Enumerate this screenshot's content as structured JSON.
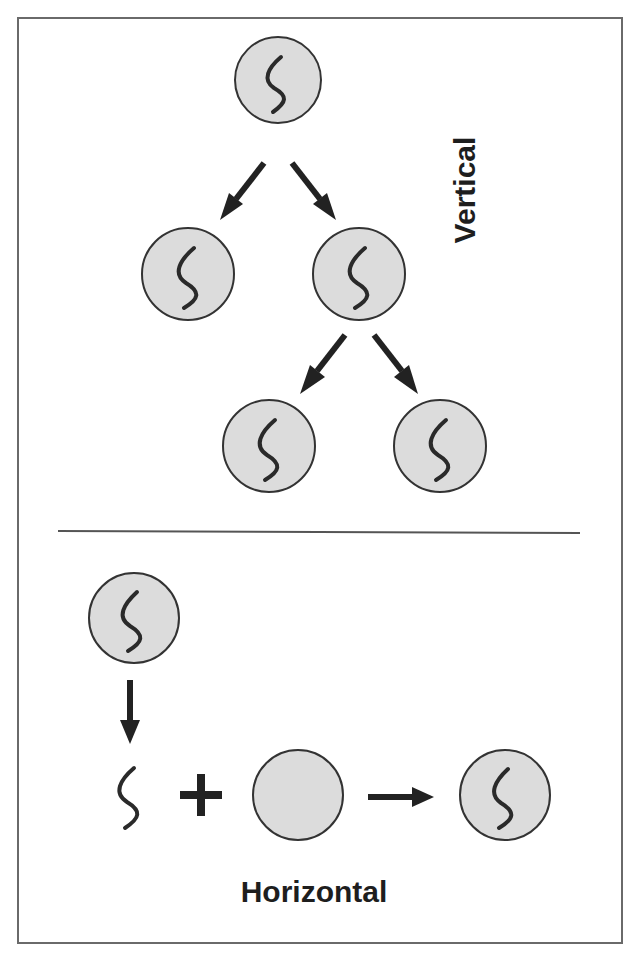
{
  "diagram": {
    "labels": {
      "vertical": "Vertical",
      "horizontal": "Horizontal"
    },
    "colors": {
      "cell_fill": "#dcdcdc",
      "cell_stroke": "#333333",
      "arrow": "#222222",
      "text": "#1e1e1e",
      "frame": "#6a6a6a"
    },
    "vertical_section": {
      "nodes": [
        {
          "id": "parent",
          "has_gene": true
        },
        {
          "id": "child-left",
          "has_gene": true
        },
        {
          "id": "child-right",
          "has_gene": true
        },
        {
          "id": "grandchild-left",
          "has_gene": true
        },
        {
          "id": "grandchild-right",
          "has_gene": true
        }
      ],
      "edges": [
        {
          "from": "parent",
          "to": "child-left"
        },
        {
          "from": "parent",
          "to": "child-right"
        },
        {
          "from": "child-right",
          "to": "grandchild-left"
        },
        {
          "from": "child-right",
          "to": "grandchild-right"
        }
      ]
    },
    "horizontal_section": {
      "nodes": [
        {
          "id": "donor",
          "has_gene": true
        },
        {
          "id": "free-gene",
          "has_gene": true
        },
        {
          "id": "recipient",
          "has_gene": false
        },
        {
          "id": "result",
          "has_gene": true
        }
      ],
      "operators": [
        "arrow-down",
        "plus",
        "arrow-right"
      ]
    }
  }
}
